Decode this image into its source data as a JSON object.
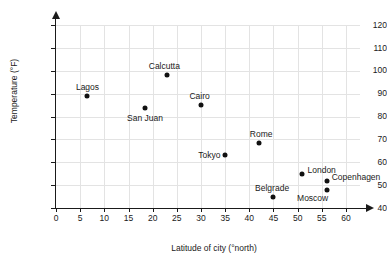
{
  "chart_data": {
    "type": "scatter",
    "title": "",
    "xlabel": "Latitude of city (°north)",
    "ylabel": "Temperature (°F)",
    "xlim": [
      0,
      60
    ],
    "ylim": [
      40,
      120
    ],
    "xticks": [
      0,
      5,
      10,
      15,
      20,
      25,
      30,
      35,
      40,
      45,
      50,
      55,
      60
    ],
    "yticks": [
      40,
      50,
      60,
      70,
      80,
      90,
      100,
      110,
      120
    ],
    "xtick_labels": [
      "0",
      "5",
      "10",
      "15",
      "20",
      "25",
      "30",
      "35",
      "40",
      "45",
      "50",
      "55",
      "60"
    ],
    "ytick_labels": [
      "40",
      "50",
      "60",
      "70",
      "80",
      "90",
      "100",
      "110",
      "120"
    ],
    "grid": true,
    "legend": "none",
    "marker_color": "#111111",
    "grid_color": "#e3e3e3",
    "axis_color": "#1a1a1a",
    "points": [
      {
        "name": "Lagos",
        "x": 6.5,
        "y": 89,
        "label_pos": "above"
      },
      {
        "name": "San Juan",
        "x": 18.5,
        "y": 83.5,
        "label_pos": "below"
      },
      {
        "name": "Calcutta",
        "x": 23,
        "y": 98,
        "label_pos": "above"
      },
      {
        "name": "Cairo",
        "x": 30,
        "y": 85,
        "label_pos": "above"
      },
      {
        "name": "Tokyo",
        "x": 35,
        "y": 63,
        "label_pos": "left"
      },
      {
        "name": "Rome",
        "x": 42,
        "y": 68.5,
        "label_pos": "above"
      },
      {
        "name": "Belgrade",
        "x": 45,
        "y": 45,
        "label_pos": "above"
      },
      {
        "name": "London",
        "x": 51,
        "y": 55,
        "label_pos": "right"
      },
      {
        "name": "Copenhagen",
        "x": 56,
        "y": 52,
        "label_pos": "right"
      },
      {
        "name": "Moscow",
        "x": 56,
        "y": 48,
        "label_pos": "below-left"
      }
    ]
  }
}
